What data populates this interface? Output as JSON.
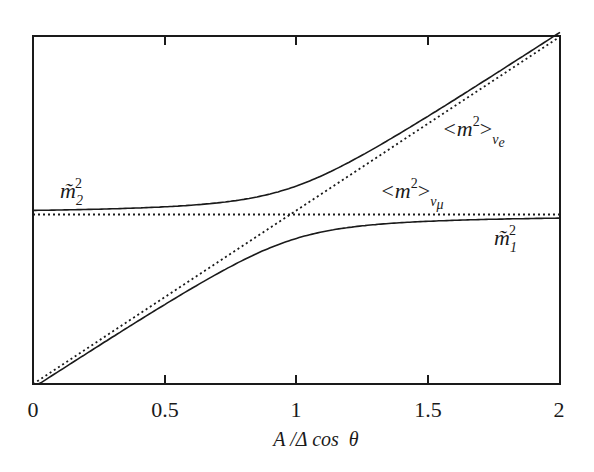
{
  "chart_data": {
    "type": "line",
    "title": "",
    "xlabel": "A /Δ cos  θ",
    "ylabel": "",
    "xlim": [
      0,
      2
    ],
    "ylim": [
      0,
      2
    ],
    "grid": false,
    "legend": "none (inline annotations)",
    "x_ticks": [
      "0",
      "0.5",
      "1",
      "1.5",
      "2"
    ],
    "x_tick_values": [
      0,
      0.5,
      1,
      1.5,
      2
    ],
    "y_ticks": [],
    "crossing_point": {
      "x": 0.975,
      "y": 0.975
    },
    "series": [
      {
        "name": "m̃₂²",
        "style": "solid",
        "description": "upper eigenvalue; flat at ~1.0 for small x, bends upward past x~1 approaching the diagonal",
        "x": [
          0,
          0.25,
          0.5,
          0.75,
          1.0,
          1.25,
          1.5,
          1.75,
          2.0
        ],
        "y": [
          0.99,
          1.0,
          1.02,
          1.07,
          1.16,
          1.32,
          1.53,
          1.76,
          1.99
        ]
      },
      {
        "name": "m̃₁²",
        "style": "solid",
        "description": "lower eigenvalue; starts at 0 along the diagonal, bends over to flatten near ~0.97",
        "x": [
          0,
          0.25,
          0.5,
          0.75,
          1.0,
          1.25,
          1.5,
          1.75,
          2.0
        ],
        "y": [
          0.0,
          0.22,
          0.46,
          0.66,
          0.82,
          0.91,
          0.95,
          0.96,
          0.97
        ]
      },
      {
        "name": "<m²>ν_e",
        "style": "dotted",
        "description": "diagonal line y = x",
        "x": [
          0,
          2
        ],
        "y": [
          0,
          2
        ]
      },
      {
        "name": "<m²>ν_μ",
        "style": "dotted",
        "description": "horizontal line",
        "x": [
          0,
          2
        ],
        "y": [
          0.975,
          0.975
        ]
      }
    ],
    "annotations": [
      {
        "text": "m̃₂²",
        "x": 0.05,
        "y": 1.1
      },
      {
        "text": "<m²>ν_e",
        "x": 1.65,
        "y": 1.55
      },
      {
        "text": "<m²>ν_μ",
        "x": 1.35,
        "y": 1.05
      },
      {
        "text": "m̃₁²",
        "x": 1.75,
        "y": 0.8
      }
    ]
  },
  "labels": {
    "xlabel": "A /Δ cos  θ",
    "ticks": [
      "0",
      "0.5",
      "1",
      "1.5",
      "2"
    ],
    "m2_tilde": "m̃",
    "m2_sub": "2",
    "m1_tilde": "m̃",
    "m1_sub": "1",
    "sq": "2",
    "nue_open": "<m",
    "nue_close": ">",
    "nue_sub": "ν",
    "nue_subsub": "e",
    "numu_open": "<m",
    "numu_close": ">",
    "numu_sub": "ν",
    "numu_subsub": "μ"
  },
  "colors": {
    "line": "#1a1a1a",
    "background": "#ffffff"
  },
  "frame": {
    "left": 33,
    "right": 560,
    "top": 36,
    "bottom": 384
  }
}
